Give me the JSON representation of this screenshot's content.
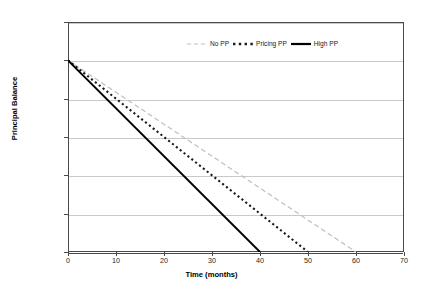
{
  "chart_data": {
    "type": "line",
    "title": "",
    "xlabel": "Time (months)",
    "ylabel": "Principal Balance",
    "xlim": [
      0,
      70
    ],
    "ylim": [
      0,
      12000
    ],
    "x_ticks": [
      "0",
      "10",
      "20",
      "30",
      "40",
      "50",
      "60",
      "70"
    ],
    "x_tick_values": [
      0,
      10,
      20,
      30,
      40,
      50,
      60,
      70
    ],
    "y_ticks": [
      "$0",
      "$2,000",
      "$4,000",
      "$6,000",
      "$8,000",
      "$10,000",
      "$12,000"
    ],
    "y_tick_values": [
      0,
      2000,
      4000,
      6000,
      8000,
      10000,
      12000
    ],
    "grid": "horizontal",
    "legend_position": "top-center",
    "series": [
      {
        "name": "No PP",
        "style": "dashed",
        "color": "#bfbfbf",
        "x": [
          0,
          60
        ],
        "values": [
          10000,
          0
        ]
      },
      {
        "name": "Pricing PP",
        "style": "dotted",
        "color": "#1a1a1a",
        "x": [
          0,
          50
        ],
        "values": [
          10000,
          0
        ]
      },
      {
        "name": "High PP",
        "style": "solid",
        "color": "#000000",
        "x": [
          0,
          40
        ],
        "values": [
          10000,
          0
        ]
      }
    ]
  },
  "legend": {
    "entries": [
      {
        "label": "No PP"
      },
      {
        "label": "Pricing PP"
      },
      {
        "label": "High PP"
      }
    ]
  },
  "axes": {
    "y_label": "Principal Balance",
    "x_label": "Time (months)"
  }
}
